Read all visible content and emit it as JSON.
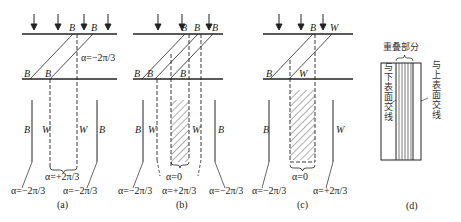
{
  "figure": {
    "panels": [
      {
        "id": "a",
        "caption": "(a)",
        "labels": {
          "top_b1": "B",
          "top_b2": "B",
          "mid_b1": "B",
          "mid_b2": "B",
          "alpha_top": "α=−2π/3",
          "side_b_left": "B",
          "side_w_left": "W",
          "side_w_right": "W",
          "side_b_right": "B",
          "alpha_center": "α=+2π/3",
          "alpha_left": "α=−2π/3",
          "alpha_right": "α=−2π/3"
        }
      },
      {
        "id": "b",
        "caption": "(b)",
        "labels": {
          "top_b1": "B",
          "top_b2": "B",
          "top_b3": "B",
          "mid_b1": "B",
          "mid_b2": "B",
          "mid_b3": "B",
          "side_b_left": "B",
          "side_w_left": "W",
          "side_w_right": "W",
          "side_b_right": "B",
          "alpha_center": "α=0",
          "alpha_left": "α=−2π/3",
          "alpha_mid": "α=+2π/3",
          "alpha_right": "α=−2π/3"
        }
      },
      {
        "id": "c",
        "caption": "(c)",
        "labels": {
          "top_b": "B",
          "top_w": "W",
          "mid_b": "B",
          "mid_w": "W",
          "side_b": "B",
          "side_w": "W",
          "alpha_center": "α=0",
          "alpha_left": "α=−2π/3",
          "alpha_right": "α=+2π/3"
        }
      },
      {
        "id": "d",
        "caption": "(d)",
        "labels": {
          "overlap": "重叠部分",
          "lower_surface": "与下表面交线",
          "upper_surface": "与上表面交线"
        }
      }
    ]
  }
}
